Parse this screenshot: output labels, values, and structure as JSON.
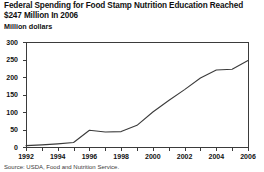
{
  "title": "Federal Spending for Food Stamp Nutrition Education Reached $247 Million In 2006",
  "source": "Source: USDA, Food and Nutrition Service.",
  "chart_data": {
    "type": "line",
    "title": "Federal Spending for Food Stamp Nutrition Education Reached $247 Million In 2006",
    "xlabel": "",
    "ylabel": "Million dollars",
    "ylim": [
      0,
      300
    ],
    "xlim": [
      1992,
      2006
    ],
    "yticks": [
      0,
      50,
      100,
      150,
      200,
      250,
      300
    ],
    "ytick_labels": [
      "0",
      "50",
      "100",
      "150",
      "200",
      "250",
      "300"
    ],
    "xticks": [
      1992,
      1993,
      1994,
      1995,
      1996,
      1997,
      1998,
      1999,
      2000,
      2001,
      2002,
      2003,
      2004,
      2005,
      2006
    ],
    "xtick_labels": [
      "1992",
      "",
      "1994",
      "",
      "1996",
      "",
      "1998",
      "",
      "2000",
      "",
      "2002",
      "",
      "2004",
      "",
      "2006"
    ],
    "grid": false,
    "legend": false,
    "line_color": "#3b3b3b",
    "series": [
      {
        "name": "Federal spending for food stamp nutrition education",
        "x": [
          1992,
          1993,
          1994,
          1995,
          1996,
          1997,
          1998,
          1999,
          2000,
          2001,
          2002,
          2003,
          2004,
          2005,
          2006
        ],
        "values": [
          4,
          6,
          9,
          13,
          48,
          43,
          44,
          62,
          100,
          133,
          164,
          197,
          220,
          222,
          247
        ]
      }
    ]
  }
}
